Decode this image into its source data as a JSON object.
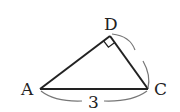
{
  "diagram": {
    "type": "right-triangle",
    "vertices": {
      "A": {
        "label": "A",
        "x": 40,
        "y": 89
      },
      "D": {
        "label": "D",
        "x": 110,
        "y": 36
      },
      "C": {
        "label": "C",
        "x": 148,
        "y": 89
      }
    },
    "right_angle_at": "D",
    "side_labels": [
      {
        "side": "AC",
        "label": "3"
      }
    ],
    "marked_arc": "DC",
    "colors": {
      "stroke": "#222222",
      "arc": "#777777",
      "background": "#ffffff"
    }
  }
}
